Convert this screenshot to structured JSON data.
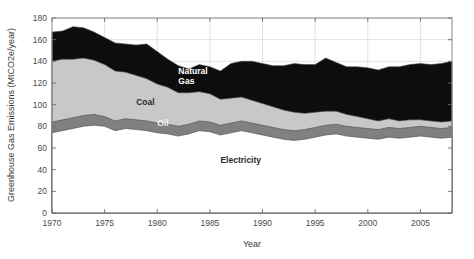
{
  "figure": {
    "background_color": "#ffffff",
    "plot_background_color": "#ffffff"
  },
  "axes": {
    "xlabel": "Year",
    "ylabel": "Greenhouse Gas Emissions (MtCO2e/year)",
    "x_ticks": [
      "1970",
      "1975",
      "1980",
      "1985",
      "1990",
      "1995",
      "2000",
      "2005"
    ],
    "y_ticks": [
      "0",
      "20",
      "40",
      "60",
      "80",
      "100",
      "120",
      "140",
      "160",
      "180"
    ],
    "xlim": [
      1970,
      2008
    ],
    "ylim": [
      0,
      180
    ],
    "grid": true
  },
  "series_labels": {
    "natural_gas": "Natural\nGas",
    "natural_gas_line1": "Natural",
    "natural_gas_line2": "Gas",
    "coal": "Coal",
    "oil": "Oil",
    "electricity": "Electricity"
  },
  "colors": {
    "electricity": "#ffffff",
    "oil": "#808080",
    "coal": "#c8c8c8",
    "natural_gas": "#0d0d0d",
    "edge": "#4a4a4a",
    "grid": "#d4d4dc",
    "axis": "#8a8a8a",
    "text": "#3a3a3a"
  },
  "chart_data": {
    "type": "area",
    "stacked": true,
    "title": "",
    "xlabel": "Year",
    "ylabel": "Greenhouse Gas Emissions (MtCO2e/year)",
    "xlim": [
      1970,
      2008
    ],
    "ylim": [
      0,
      180
    ],
    "grid": true,
    "legend_position": "inline-annotations",
    "x": [
      1970,
      1971,
      1972,
      1973,
      1974,
      1975,
      1976,
      1977,
      1978,
      1979,
      1980,
      1981,
      1982,
      1983,
      1984,
      1985,
      1986,
      1987,
      1988,
      1989,
      1990,
      1991,
      1992,
      1993,
      1994,
      1995,
      1996,
      1997,
      1998,
      1999,
      2000,
      2001,
      2002,
      2003,
      2004,
      2005,
      2006,
      2007,
      2008
    ],
    "series": [
      {
        "name": "Electricity",
        "color": "#ffffff",
        "values": [
          74,
          76,
          78,
          80,
          81,
          80,
          76,
          78,
          77,
          76,
          74,
          73,
          71,
          73,
          76,
          75,
          72,
          74,
          76,
          74,
          72,
          70,
          68,
          67,
          68,
          70,
          72,
          73,
          71,
          70,
          69,
          68,
          70,
          69,
          70,
          71,
          70,
          69,
          70
        ]
      },
      {
        "name": "Oil",
        "color": "#808080",
        "values": [
          10,
          10,
          10,
          10,
          10,
          9,
          9,
          9,
          9,
          9,
          9,
          9,
          9,
          9,
          9,
          9,
          9,
          9,
          9,
          9,
          9,
          9,
          9,
          9,
          9,
          9,
          9,
          9,
          9,
          9,
          9,
          9,
          9,
          9,
          9,
          9,
          9,
          9,
          9
        ]
      },
      {
        "name": "Coal",
        "color": "#c8c8c8",
        "values": [
          56,
          56,
          54,
          53,
          50,
          48,
          46,
          43,
          41,
          39,
          36,
          34,
          31,
          29,
          27,
          26,
          24,
          23,
          22,
          21,
          20,
          19,
          18,
          17,
          15,
          14,
          13,
          12,
          11,
          10,
          9,
          8,
          8,
          7,
          7,
          6,
          6,
          6,
          6
        ]
      },
      {
        "name": "Natural Gas",
        "color": "#0d0d0d",
        "values": [
          27,
          26,
          30,
          28,
          26,
          25,
          26,
          26,
          28,
          32,
          30,
          26,
          25,
          22,
          25,
          25,
          26,
          32,
          33,
          36,
          37,
          38,
          41,
          45,
          45,
          44,
          49,
          45,
          44,
          46,
          47,
          47,
          48,
          50,
          51,
          52,
          52,
          54,
          55
        ]
      }
    ],
    "stack_tops": {
      "electricity": [
        74,
        76,
        78,
        80,
        81,
        80,
        76,
        78,
        77,
        76,
        74,
        73,
        71,
        73,
        76,
        75,
        72,
        74,
        76,
        74,
        72,
        70,
        68,
        67,
        68,
        70,
        72,
        73,
        71,
        70,
        69,
        68,
        70,
        69,
        70,
        71,
        70,
        69,
        70
      ],
      "oil": [
        84,
        86,
        88,
        90,
        91,
        89,
        85,
        87,
        86,
        85,
        83,
        82,
        80,
        82,
        85,
        84,
        81,
        83,
        85,
        83,
        81,
        79,
        77,
        76,
        77,
        79,
        81,
        82,
        80,
        79,
        78,
        77,
        79,
        78,
        79,
        80,
        79,
        78,
        79
      ],
      "coal": [
        140,
        142,
        142,
        143,
        141,
        137,
        131,
        130,
        127,
        124,
        119,
        116,
        111,
        111,
        112,
        110,
        105,
        106,
        107,
        104,
        101,
        98,
        95,
        93,
        92,
        93,
        94,
        94,
        91,
        89,
        87,
        85,
        87,
        85,
        86,
        86,
        85,
        84,
        85
      ],
      "natural_gas": [
        167,
        168,
        172,
        171,
        167,
        162,
        157,
        156,
        155,
        156,
        149,
        142,
        136,
        133,
        137,
        135,
        131,
        138,
        140,
        140,
        138,
        136,
        136,
        138,
        137,
        137,
        143,
        139,
        135,
        135,
        134,
        132,
        135,
        135,
        137,
        138,
        137,
        138,
        140
      ]
    },
    "total": [
      167,
      168,
      172,
      171,
      167,
      162,
      157,
      156,
      155,
      156,
      149,
      142,
      136,
      133,
      137,
      135,
      131,
      138,
      140,
      140,
      138,
      136,
      136,
      138,
      137,
      137,
      143,
      139,
      135,
      135,
      134,
      132,
      135,
      135,
      137,
      138,
      137,
      138,
      140
    ]
  },
  "annotations": [
    {
      "text": "Natural Gas",
      "x": 1982,
      "y": 128,
      "color_on": "dark"
    },
    {
      "text": "Coal",
      "x": 1978,
      "y": 100,
      "color_on": "light"
    },
    {
      "text": "Oil",
      "x": 1980,
      "y": 80,
      "color_on": "mid"
    },
    {
      "text": "Electricity",
      "x": 1986,
      "y": 46,
      "color_on": "light"
    }
  ]
}
